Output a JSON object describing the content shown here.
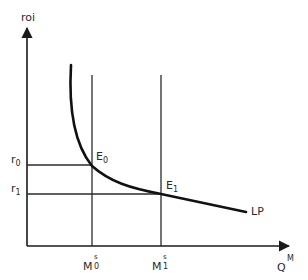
{
  "diagram": {
    "title": "",
    "y_axis": {
      "label": "roi"
    },
    "x_axis": {
      "label_base": "Q",
      "label_sup": "M"
    },
    "curve": {
      "label": "LP"
    },
    "points": [
      {
        "name": "E",
        "sub": "0",
        "r_label_base": "r",
        "r_label_sub": "0",
        "m_label_base": "M",
        "m_label_sup": "s",
        "m_label_sub": "0"
      },
      {
        "name": "E",
        "sub": "1",
        "r_label_base": "r",
        "r_label_sub": "1",
        "m_label_base": "M",
        "m_label_sup": "s",
        "m_label_sub": "1"
      }
    ],
    "colors": {
      "axis": "#1a1a1a",
      "curve": "#111111",
      "guide": "#2b2b2b",
      "text": "#2a2a2a"
    }
  }
}
